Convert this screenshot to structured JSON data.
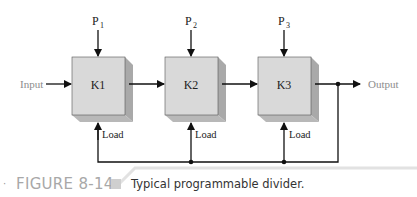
{
  "diagram": {
    "input_label": "Input",
    "output_label": "Output",
    "blocks": [
      {
        "label": "K1",
        "preset_label": "P",
        "preset_sub": "1",
        "load_label": "Load"
      },
      {
        "label": "K2",
        "preset_label": "P",
        "preset_sub": "2",
        "load_label": "Load"
      },
      {
        "label": "K3",
        "preset_label": "P",
        "preset_sub": "3",
        "load_label": "Load"
      }
    ],
    "colors": {
      "block_face": "#d9d9d9",
      "block_side": "#a9a9a9",
      "block_bottom": "#b8b8b8",
      "line": "#111111",
      "label_gray": "#8c8c8c"
    }
  },
  "caption": {
    "figure_number": "FIGURE 8-14",
    "text": "Typical programmable divider."
  }
}
